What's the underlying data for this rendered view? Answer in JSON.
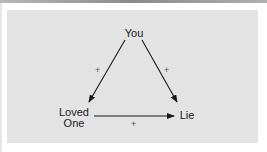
{
  "diagram": {
    "type": "balance-triangle",
    "nodes": {
      "you": {
        "label": "You"
      },
      "loved_one": {
        "line1": "Loved",
        "line2": "One"
      },
      "lie": {
        "label": "Lie"
      }
    },
    "edges": [
      {
        "from": "You",
        "to": "Loved One",
        "sign": "+"
      },
      {
        "from": "You",
        "to": "Lie",
        "sign": "+"
      },
      {
        "from": "Loved One",
        "to": "Lie",
        "sign": "+"
      }
    ],
    "colors": {
      "panel": "#e3e3e3",
      "line": "#1a1a1a",
      "sign": "#555555"
    }
  }
}
